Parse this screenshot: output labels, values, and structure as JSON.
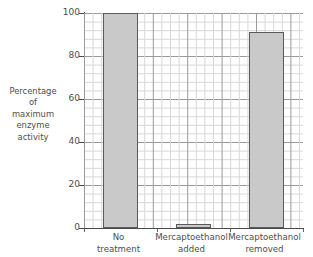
{
  "chart_data": {
    "type": "bar",
    "title": "",
    "xlabel": "",
    "ylabel": "Percentage of maximum enzyme activity",
    "ylabel_lines": [
      "Percentage",
      "of",
      "maximum",
      "enzyme",
      "activity"
    ],
    "categories": [
      "No treatment",
      "Mercaptoethanol added",
      "Mercaptoethanol removed"
    ],
    "category_lines": [
      [
        "No",
        "treatment"
      ],
      [
        "Mercaptoethanol",
        "added"
      ],
      [
        "Mercaptoethanol",
        "removed"
      ]
    ],
    "values": [
      100,
      2,
      91
    ],
    "ylim": [
      0,
      100
    ],
    "yticks": [
      0,
      20,
      40,
      60,
      80,
      100
    ],
    "ytick_labels": [
      "0",
      "20",
      "40",
      "60",
      "80",
      "100"
    ],
    "minor_tick_step": 4,
    "grid": true,
    "grid_major_color": "#9a9a9a",
    "grid_minor_color": "#d8d8d8",
    "legend": null,
    "bar_fill_color": "#c9c9c9",
    "bar_edge_color": "#5a5a5a",
    "axis_color": "#4a4a4a",
    "text_color": "#4d4d4d",
    "background_color": "#ffffff"
  }
}
